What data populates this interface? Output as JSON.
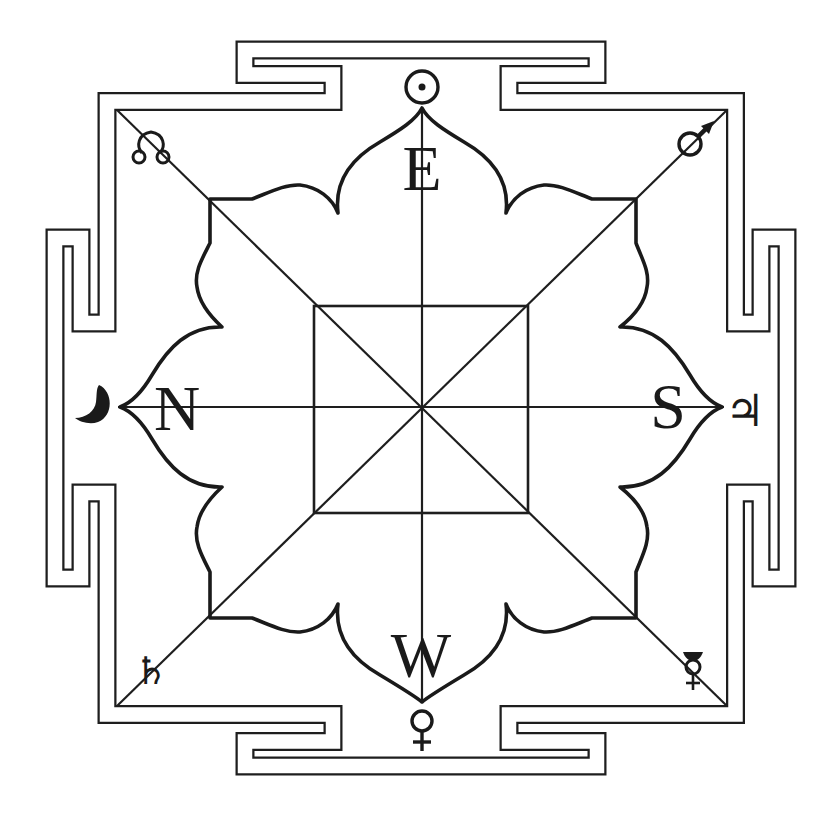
{
  "diagram": {
    "colors": {
      "ink": "#1a1a1a",
      "background": "#ffffff"
    },
    "directions": {
      "top": {
        "label": "E",
        "name": "East"
      },
      "left": {
        "label": "N",
        "name": "North"
      },
      "right": {
        "label": "S",
        "name": "South"
      },
      "bottom": {
        "label": "W",
        "name": "West"
      }
    },
    "planets": {
      "top": {
        "glyph": "☉",
        "name": "Sun",
        "icon": "sun-icon"
      },
      "left": {
        "glyph": "☽",
        "name": "Moon",
        "icon": "moon-icon"
      },
      "right": {
        "glyph": "♃",
        "name": "Jupiter",
        "icon": "jupiter-icon"
      },
      "bottom": {
        "glyph": "♀",
        "name": "Venus",
        "icon": "venus-icon"
      },
      "top_left": {
        "glyph": "☊",
        "name": "Rahu (North Node)",
        "icon": "north-node-icon"
      },
      "top_right": {
        "glyph": "♂",
        "name": "Mars",
        "icon": "mars-icon"
      },
      "bottom_left": {
        "glyph": "♄",
        "name": "Saturn",
        "icon": "saturn-icon"
      },
      "bottom_right": {
        "glyph": "☿",
        "name": "Mercury",
        "icon": "mercury-icon"
      }
    },
    "structure": {
      "border": "double-line meander (labyrinth) square frame",
      "lotus_petals": 8,
      "inner_square": true,
      "axes": [
        "vertical",
        "horizontal",
        "diagonal NW-SE",
        "diagonal NE-SW"
      ]
    }
  }
}
